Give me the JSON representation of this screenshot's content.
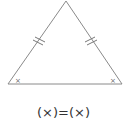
{
  "diagram": {
    "type": "isosceles-triangle",
    "stroke_color": "#8a8a8a",
    "vertices": {
      "apex": [
        66,
        1
      ],
      "left": [
        8,
        84
      ],
      "right": [
        122,
        84
      ]
    },
    "equal_side_marks": "double-tick",
    "angle_labels": {
      "left": "×",
      "right": "×"
    },
    "formula": "(×)=(×)"
  }
}
